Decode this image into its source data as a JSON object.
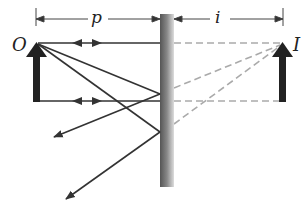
{
  "diagram": {
    "labels": {
      "object": "O",
      "image": "I",
      "object_distance": "p",
      "image_distance": "i"
    },
    "colors": {
      "ray": "#333333",
      "virtual_ray": "#aaaaaa",
      "arrow": "#222222",
      "mirror_dark": "#555555",
      "mirror_light": "#cccccc"
    }
  }
}
